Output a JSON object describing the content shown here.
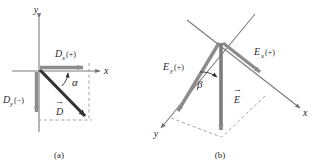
{
  "figure": {
    "background_color": "#ffffff",
    "ink_color": "#2b2b2b",
    "component_arrow_color": "#8c8c8c",
    "resultant_arrow_color": "#333333",
    "dashed_color": "#9a9a9a"
  },
  "panels": [
    {
      "id": "a",
      "caption": "(a)",
      "axes": {
        "y_label": "y",
        "x_label": "x"
      },
      "vectors": [
        {
          "name": "D-x-component",
          "label_base": "D",
          "label_sub": "x",
          "label_sign": "(+)",
          "full_label": "Dx(+)",
          "style": "component",
          "direction": "right"
        },
        {
          "name": "D-y-component",
          "label_base": "D",
          "label_sub": "y",
          "label_sign": "(−)",
          "full_label": "Dy(−)",
          "style": "component",
          "direction": "down"
        },
        {
          "name": "D-resultant",
          "label_base": "D",
          "label_sub": "",
          "label_sign": "",
          "full_label": "D",
          "style": "resultant",
          "direction": "down-right",
          "has_vector_arrow": true
        }
      ],
      "angle": {
        "name": "alpha",
        "symbol": "α"
      }
    },
    {
      "id": "b",
      "caption": "(b)",
      "axes": {
        "y_label": "y",
        "x_label": "x"
      },
      "vectors": [
        {
          "name": "E-x-component",
          "label_base": "E",
          "label_sub": "x",
          "label_sign": "(+)",
          "full_label": "Ex(+)",
          "style": "component",
          "direction": "down-right"
        },
        {
          "name": "E-y-component",
          "label_base": "E",
          "label_sub": "y",
          "label_sign": "(+)",
          "full_label": "Ey(+)",
          "style": "component",
          "direction": "down-left"
        },
        {
          "name": "E-resultant",
          "label_base": "E",
          "label_sub": "",
          "label_sign": "",
          "full_label": "E",
          "style": "resultant",
          "direction": "down",
          "has_vector_arrow": true
        }
      ],
      "angle": {
        "name": "beta",
        "symbol": "β"
      }
    }
  ]
}
